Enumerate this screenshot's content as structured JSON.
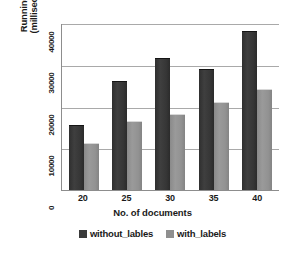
{
  "chart_data": {
    "type": "bar",
    "title": "",
    "xlabel": "No. of documents",
    "ylabel_line1": "Running time",
    "ylabel_line2": "(milliseconds)",
    "ylabel": "Running time (milliseconds)",
    "categories": [
      "20",
      "25",
      "30",
      "35",
      "40"
    ],
    "yticks": [
      "0",
      "10000",
      "20000",
      "30000",
      "40000"
    ],
    "ylim": [
      0,
      40000
    ],
    "grid": true,
    "legend_position": "bottom",
    "series": [
      {
        "name": "without_lables",
        "color": "#3a3a3a",
        "values": [
          15500,
          26000,
          31500,
          29000,
          38000
        ]
      },
      {
        "name": "with_labels",
        "color": "#8f8f8f",
        "values": [
          11000,
          16500,
          18000,
          21000,
          24000
        ]
      }
    ]
  }
}
